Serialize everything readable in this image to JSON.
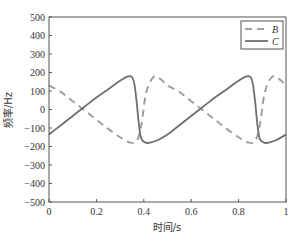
{
  "chart_data": {
    "type": "line",
    "title": "",
    "xlabel": "时间/s",
    "ylabel": "频率/Hz",
    "xlim": [
      0,
      1
    ],
    "ylim": [
      -500,
      500
    ],
    "xticks": [
      0,
      0.2,
      0.4,
      0.6,
      0.8,
      1
    ],
    "xtick_labels": [
      "0",
      "0.2",
      "0.4",
      "0.6",
      "0.8",
      "1"
    ],
    "yticks": [
      500,
      400,
      300,
      200,
      100,
      0,
      -100,
      -200,
      -300,
      -400,
      -500
    ],
    "ytick_labels": [
      "500",
      "400",
      "300",
      "200",
      "100",
      "0",
      "−100",
      "−200",
      "−300",
      "−400",
      "−500"
    ],
    "grid": false,
    "legend_position": "upper right",
    "series": [
      {
        "name": "B",
        "style": "dashed",
        "color": "#a0a0a0",
        "x": [
          0,
          0.05,
          0.1,
          0.15,
          0.2,
          0.25,
          0.3,
          0.34,
          0.37,
          0.39,
          0.41,
          0.44,
          0.47,
          0.5,
          0.55,
          0.6,
          0.65,
          0.7,
          0.75,
          0.8,
          0.84,
          0.87,
          0.89,
          0.91,
          0.94,
          0.97,
          1.0
        ],
        "values": [
          130,
          95,
          45,
          -5,
          -55,
          -105,
          -150,
          -178,
          -170,
          -80,
          90,
          175,
          165,
          130,
          95,
          45,
          -5,
          -55,
          -105,
          -150,
          -178,
          -170,
          -80,
          90,
          175,
          165,
          130
        ]
      },
      {
        "name": "C",
        "style": "solid",
        "color": "#6e6e6e",
        "x": [
          0,
          0.05,
          0.1,
          0.15,
          0.2,
          0.25,
          0.3,
          0.33,
          0.35,
          0.36,
          0.37,
          0.38,
          0.39,
          0.41,
          0.43,
          0.46,
          0.5,
          0.55,
          0.6,
          0.65,
          0.7,
          0.75,
          0.8,
          0.83,
          0.85,
          0.86,
          0.87,
          0.88,
          0.89,
          0.91,
          0.93,
          0.96,
          1.0
        ],
        "values": [
          -135,
          -85,
          -35,
          15,
          65,
          110,
          155,
          178,
          175,
          140,
          40,
          -90,
          -160,
          -180,
          -178,
          -165,
          -135,
          -85,
          -35,
          15,
          65,
          110,
          155,
          178,
          175,
          140,
          40,
          -90,
          -160,
          -180,
          -178,
          -165,
          -135
        ]
      }
    ]
  },
  "legend": {
    "items": [
      {
        "label": "B",
        "style": "dashed"
      },
      {
        "label": "C",
        "style": "solid"
      }
    ]
  }
}
